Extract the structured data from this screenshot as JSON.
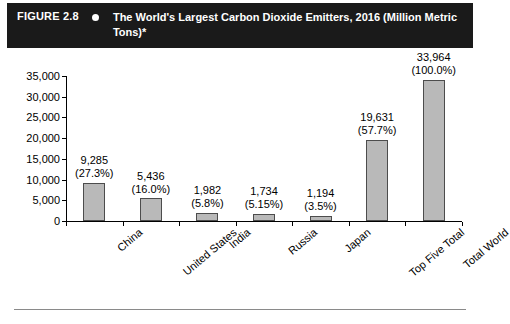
{
  "header": {
    "figure_number": "FIGURE 2.8",
    "bullet_icon": "bullet-dot-icon",
    "title": "The World's Largest Carbon Dioxide Emitters, 2016 (Million Metric Tons)*",
    "background_color": "#1a1a1a",
    "text_color": "#ffffff"
  },
  "chart_data": {
    "type": "bar",
    "title": "The World's Largest Carbon Dioxide Emitters, 2016 (Million Metric Tons)*",
    "xlabel": "",
    "ylabel": "",
    "ylim": [
      0,
      35000
    ],
    "ytick_values": [
      0,
      5000,
      10000,
      15000,
      20000,
      25000,
      30000,
      35000
    ],
    "ytick_labels": [
      "0",
      "5,000",
      "10,000",
      "15,000",
      "20,000",
      "25,000",
      "30,000",
      "35,000"
    ],
    "grid": false,
    "legend": false,
    "bar_color": "#b9b9b9",
    "bar_border_color": "#4c4c4c",
    "categories": [
      "China",
      "United States",
      "India",
      "Russia",
      "Japan",
      "Top Five Total",
      "Total World"
    ],
    "values": [
      9285,
      5436,
      1982,
      1734,
      1194,
      19631,
      33964
    ],
    "value_labels": [
      "9,285",
      "5,436",
      "1,982",
      "1,734",
      "1,194",
      "19,631",
      "33,964"
    ],
    "percent_labels": [
      "(27.3%)",
      "(16.0%)",
      "(5.8%)",
      "(5.15%)",
      "(3.5%)",
      "(57.7%)",
      "(100.0%)"
    ],
    "percent_values": [
      27.3,
      16.0,
      5.8,
      5.15,
      3.5,
      57.7,
      100.0
    ]
  }
}
